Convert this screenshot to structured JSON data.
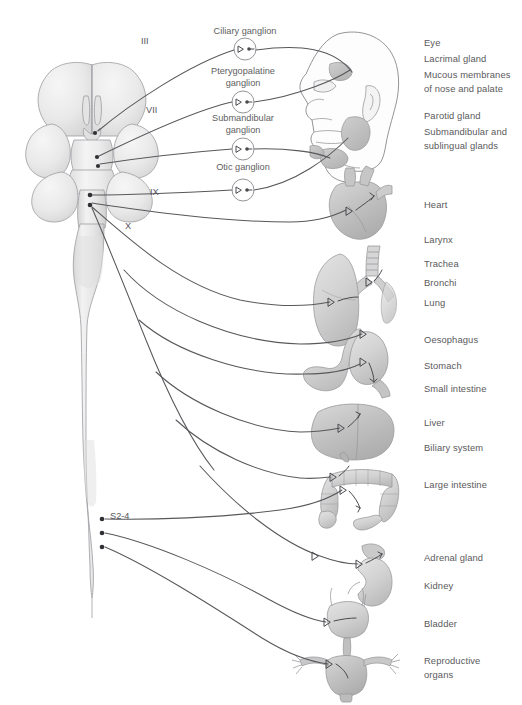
{
  "figure": {
    "width": 522,
    "height": 705,
    "background": "#ffffff"
  },
  "colors": {
    "nerve_line": "#58585c",
    "label_text": "#58585a",
    "organ_fill_light": "#e8e8e8",
    "organ_fill_mid": "#c8c8c8",
    "organ_fill_dark": "#b0b0b0",
    "cns_fill": "#eeeeee",
    "outline": "#9a9a9e",
    "ganglion_stroke": "#8a8a8e",
    "outflow_dot": "#303034"
  },
  "cranial_nerves": [
    {
      "id": "nerve-III",
      "numeral": "III",
      "x": 141,
      "y": 44
    },
    {
      "id": "nerve-VII",
      "numeral": "VII",
      "x": 146,
      "y": 113
    },
    {
      "id": "nerve-IX",
      "numeral": "IX",
      "x": 150,
      "y": 195
    },
    {
      "id": "nerve-X",
      "numeral": "X",
      "x": 125,
      "y": 229
    }
  ],
  "sacral_outflow": {
    "id": "sacral-outflow",
    "label": "S2-4",
    "x": 110,
    "y": 519
  },
  "ganglia": [
    {
      "id": "ciliary-ganglion",
      "lines": [
        "Ciliary ganglion"
      ],
      "label_x": 245,
      "label_y": 34,
      "cx": 245,
      "cy": 49,
      "r": 11
    },
    {
      "id": "pterygopalatine-ganglion",
      "lines": [
        "Pterygopalatine",
        "ganglion"
      ],
      "label_x": 243,
      "label_y": 74,
      "cx": 243,
      "cy": 102,
      "r": 11
    },
    {
      "id": "submandibular-ganglion",
      "lines": [
        "Submandibular",
        "ganglion"
      ],
      "label_x": 243,
      "label_y": 121,
      "cx": 243,
      "cy": 149,
      "r": 11
    },
    {
      "id": "otic-ganglion",
      "lines": [
        "Otic ganglion"
      ],
      "label_x": 243,
      "label_y": 170,
      "cx": 243,
      "cy": 190,
      "r": 11
    }
  ],
  "organ_labels": [
    {
      "id": "label-eye",
      "text": "Eye",
      "x": 424,
      "y": 46
    },
    {
      "id": "label-lacrimal-gland",
      "text": "Lacrimal gland",
      "x": 424,
      "y": 62
    },
    {
      "id": "label-mucous-membranes-1",
      "text": "Mucous membranes",
      "x": 424,
      "y": 78
    },
    {
      "id": "label-mucous-membranes-2",
      "text": "of nose and palate",
      "x": 424,
      "y": 92
    },
    {
      "id": "label-parotid-gland",
      "text": "Parotid gland",
      "x": 424,
      "y": 119
    },
    {
      "id": "label-submandibular-sublingual-1",
      "text": "Submandibular and",
      "x": 424,
      "y": 135
    },
    {
      "id": "label-submandibular-sublingual-2",
      "text": "sublingual glands",
      "x": 424,
      "y": 149
    },
    {
      "id": "label-heart",
      "text": "Heart",
      "x": 424,
      "y": 208
    },
    {
      "id": "label-larynx",
      "text": "Larynx",
      "x": 424,
      "y": 243
    },
    {
      "id": "label-trachea",
      "text": "Trachea",
      "x": 424,
      "y": 267
    },
    {
      "id": "label-bronchi",
      "text": "Bronchi",
      "x": 424,
      "y": 286
    },
    {
      "id": "label-lung",
      "text": "Lung",
      "x": 424,
      "y": 306
    },
    {
      "id": "label-oesophagus",
      "text": "Oesophagus",
      "x": 424,
      "y": 343
    },
    {
      "id": "label-stomach",
      "text": "Stomach",
      "x": 424,
      "y": 369
    },
    {
      "id": "label-small-intestine",
      "text": "Small intestine",
      "x": 424,
      "y": 392
    },
    {
      "id": "label-liver",
      "text": "Liver",
      "x": 424,
      "y": 426
    },
    {
      "id": "label-biliary-system",
      "text": "Biliary system",
      "x": 424,
      "y": 451
    },
    {
      "id": "label-large-intestine",
      "text": "Large intestine",
      "x": 424,
      "y": 488
    },
    {
      "id": "label-adrenal-gland",
      "text": "Adrenal gland",
      "x": 424,
      "y": 561
    },
    {
      "id": "label-kidney",
      "text": "Kidney",
      "x": 424,
      "y": 589
    },
    {
      "id": "label-bladder",
      "text": "Bladder",
      "x": 424,
      "y": 627
    },
    {
      "id": "label-reproductive-1",
      "text": "Reproductive",
      "x": 424,
      "y": 664
    },
    {
      "id": "label-reproductive-2",
      "text": "organs",
      "x": 424,
      "y": 678
    }
  ],
  "anatomy_parts": [
    {
      "id": "brain",
      "name": "brain-ventral-view"
    },
    {
      "id": "spinal-cord",
      "name": "spinal-cord"
    },
    {
      "id": "head",
      "name": "head-profile-with-glands"
    },
    {
      "id": "heart",
      "name": "heart"
    },
    {
      "id": "lung",
      "name": "lung-trachea-bronchi"
    },
    {
      "id": "stomach",
      "name": "stomach-and-duodenum"
    },
    {
      "id": "liver",
      "name": "liver"
    },
    {
      "id": "large-intestine",
      "name": "large-intestine"
    },
    {
      "id": "kidney",
      "name": "kidney-with-adrenal-gland"
    },
    {
      "id": "bladder",
      "name": "bladder"
    },
    {
      "id": "reproductive-organs",
      "name": "uterus-with-ovaries"
    }
  ]
}
